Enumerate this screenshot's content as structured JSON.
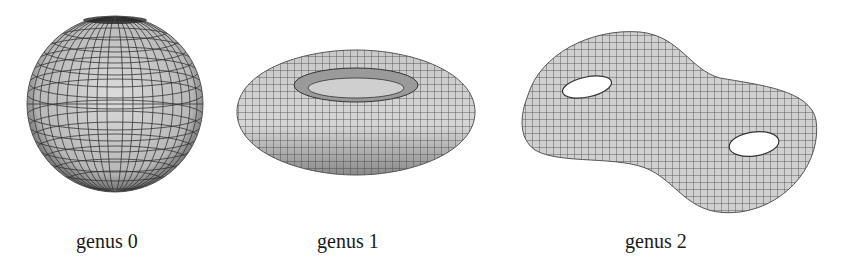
{
  "figure": {
    "panels": [
      {
        "shape": "sphere",
        "label": "genus 0"
      },
      {
        "shape": "torus",
        "label": "genus 1"
      },
      {
        "shape": "double-torus",
        "label": "genus 2"
      }
    ]
  }
}
